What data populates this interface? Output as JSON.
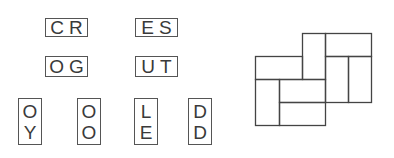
{
  "tiles": {
    "horizontal": [
      {
        "id": "cr",
        "letters": [
          "C",
          "R"
        ]
      },
      {
        "id": "es",
        "letters": [
          "E",
          "S"
        ]
      },
      {
        "id": "og",
        "letters": [
          "O",
          "G"
        ]
      },
      {
        "id": "ut",
        "letters": [
          "U",
          "T"
        ]
      }
    ],
    "vertical": [
      {
        "id": "oy",
        "letters": [
          "O",
          "Y"
        ]
      },
      {
        "id": "oo",
        "letters": [
          "O",
          "O"
        ]
      },
      {
        "id": "le",
        "letters": [
          "L",
          "E"
        ]
      },
      {
        "id": "dd",
        "letters": [
          "D",
          "D"
        ]
      }
    ]
  },
  "puzzle_grid": {
    "line_color": "#444444",
    "cells": [
      {
        "name": "top-right-horizontal",
        "x": 325,
        "y": 33,
        "w": 46,
        "h": 23
      },
      {
        "name": "top-middle-vertical",
        "x": 302,
        "y": 33,
        "w": 23,
        "h": 46
      },
      {
        "name": "left-upper-horizontal",
        "x": 255,
        "y": 56,
        "w": 47,
        "h": 23
      },
      {
        "name": "right-vertical-a",
        "x": 325,
        "y": 56,
        "w": 23,
        "h": 46
      },
      {
        "name": "right-vertical-b",
        "x": 348,
        "y": 56,
        "w": 23,
        "h": 46
      },
      {
        "name": "bottom-left-vertical",
        "x": 255,
        "y": 79,
        "w": 24,
        "h": 46
      },
      {
        "name": "middle-horizontal",
        "x": 279,
        "y": 79,
        "w": 46,
        "h": 23
      },
      {
        "name": "bottom-horizontal",
        "x": 279,
        "y": 102,
        "w": 46,
        "h": 23
      }
    ]
  }
}
